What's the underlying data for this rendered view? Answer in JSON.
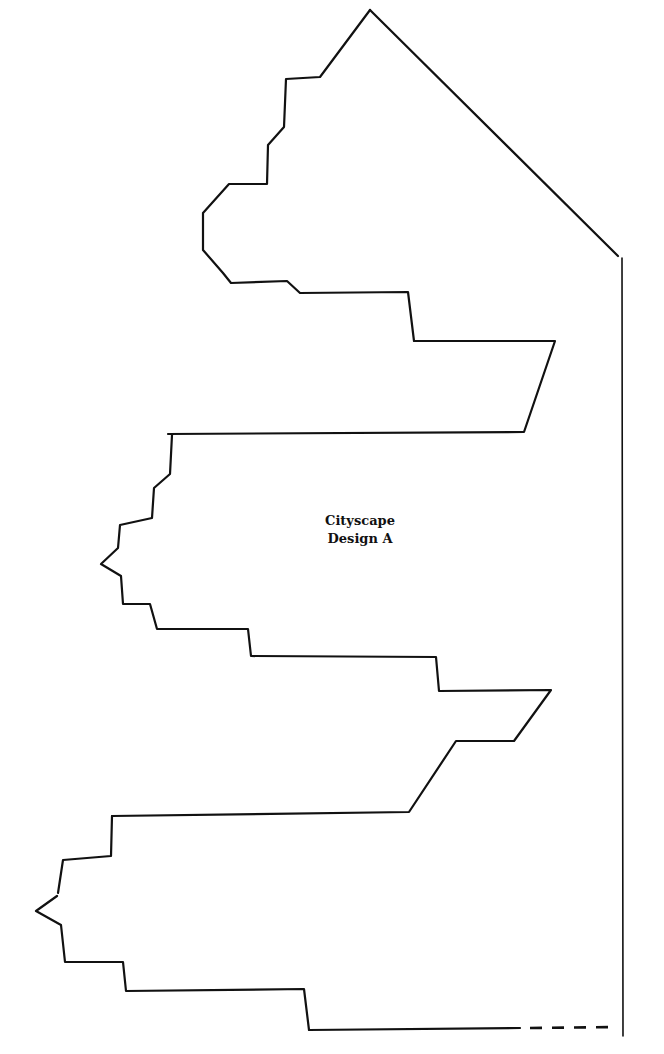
{
  "title_lines": [
    "Cityscape",
    "Design A"
  ],
  "colors": {
    "stroke": "#111111",
    "background": "#ffffff"
  },
  "template": {
    "roof_diagonal": "370,10 618,256",
    "right_edge": "622,258 623,1036",
    "upper_building": "370,10 320,77 286,79 284,127 268,145 267,184 229,184 203,213 203,250 223,273 231,283 287,281 300,293 408,292 414,341 555,341 524,432 168,434",
    "middle_building": "172,435 170,474 154,488 152,518 120,525 118,548 101,564 121,576 123,604 150,604 157,629 248,629 251,656 436,657 439,691 551,690 514,741 456,741 409,812 112,816",
    "lower_building_top": "112,816 111,856 63,860 58,893",
    "lower_building_bottom": "57,896 36,911 61,925 65,962 123,962 126,991 304,989 309,1030 520,1028",
    "fold_line_dashed": "530,1028 616,1027"
  }
}
